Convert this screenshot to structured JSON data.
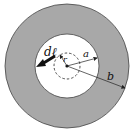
{
  "diagram": {
    "type": "coaxial-cross-section",
    "labels": {
      "dl": "dℓ",
      "r": "r",
      "a": "a",
      "b": "b"
    },
    "colors": {
      "outer_conductor": "#a8a8a8",
      "inner_region": "#ffffff",
      "stroke": "#222222"
    },
    "geometry": {
      "center": [
        67,
        66
      ],
      "outer_radius_b": 62,
      "inner_radius_a": 32,
      "amperian_radius_r": 13
    }
  }
}
